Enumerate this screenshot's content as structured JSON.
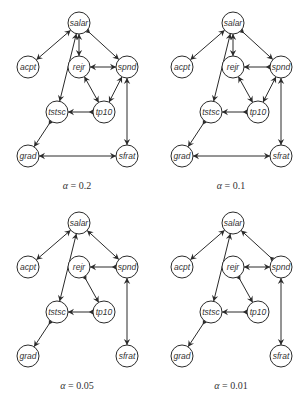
{
  "figure": {
    "node_radius": 11,
    "nodes": [
      {
        "id": "salar",
        "label": "salar",
        "x": 79,
        "y": 23
      },
      {
        "id": "acpt",
        "label": "acpt",
        "x": 28,
        "y": 67
      },
      {
        "id": "rejr",
        "label": "rejr",
        "x": 79,
        "y": 67
      },
      {
        "id": "spnd",
        "label": "spnd",
        "x": 127,
        "y": 67
      },
      {
        "id": "tstsc",
        "label": "tstsc",
        "x": 57,
        "y": 112
      },
      {
        "id": "tp10",
        "label": "tp10",
        "x": 104,
        "y": 112
      },
      {
        "id": "grad",
        "label": "grad",
        "x": 28,
        "y": 156
      },
      {
        "id": "sfrat",
        "label": "sfrat",
        "x": 127,
        "y": 156
      }
    ],
    "colors": {
      "stroke": "#2b2b2b",
      "text": "#333333",
      "background": "#ffffff"
    },
    "panels": [
      {
        "caption_symbol": "α",
        "caption_value": "= 0.2",
        "edges": [
          {
            "from": "salar",
            "to": "acpt",
            "type": "both"
          },
          {
            "from": "salar",
            "to": "rejr",
            "type": "both"
          },
          {
            "from": "salar",
            "to": "spnd",
            "type": "directed"
          },
          {
            "from": "salar",
            "to": "tstsc",
            "type": "both"
          },
          {
            "from": "rejr",
            "to": "spnd",
            "type": "both"
          },
          {
            "from": "rejr",
            "to": "tp10",
            "type": "both"
          },
          {
            "from": "spnd",
            "to": "tp10",
            "type": "both"
          },
          {
            "from": "tp10",
            "to": "tstsc",
            "type": "directed"
          },
          {
            "from": "tstsc",
            "to": "grad",
            "type": "directed"
          },
          {
            "from": "grad",
            "to": "sfrat",
            "type": "both"
          },
          {
            "from": "spnd",
            "to": "sfrat",
            "type": "both"
          }
        ]
      },
      {
        "caption_symbol": "α",
        "caption_value": "= 0.1",
        "edges": [
          {
            "from": "salar",
            "to": "acpt",
            "type": "both"
          },
          {
            "from": "salar",
            "to": "rejr",
            "type": "both"
          },
          {
            "from": "salar",
            "to": "spnd",
            "type": "directed"
          },
          {
            "from": "salar",
            "to": "tstsc",
            "type": "both"
          },
          {
            "from": "spnd",
            "to": "rejr",
            "type": "directed"
          },
          {
            "from": "rejr",
            "to": "tp10",
            "type": "both"
          },
          {
            "from": "spnd",
            "to": "tp10",
            "type": "both"
          },
          {
            "from": "tp10",
            "to": "tstsc",
            "type": "directed"
          },
          {
            "from": "tstsc",
            "to": "grad",
            "type": "directed"
          },
          {
            "from": "grad",
            "to": "sfrat",
            "type": "both"
          },
          {
            "from": "spnd",
            "to": "sfrat",
            "type": "both"
          }
        ]
      },
      {
        "caption_symbol": "α",
        "caption_value": "= 0.05",
        "edges": [
          {
            "from": "salar",
            "to": "acpt",
            "type": "both"
          },
          {
            "from": "salar",
            "to": "tstsc",
            "type": "both"
          },
          {
            "from": "salar",
            "to": "spnd",
            "type": "both"
          },
          {
            "from": "spnd",
            "to": "rejr",
            "type": "directed"
          },
          {
            "from": "rejr",
            "to": "tp10",
            "type": "directed"
          },
          {
            "from": "tp10",
            "to": "tstsc",
            "type": "directed"
          },
          {
            "from": "tstsc",
            "to": "grad",
            "type": "directed"
          },
          {
            "from": "spnd",
            "to": "sfrat",
            "type": "both"
          }
        ]
      },
      {
        "caption_symbol": "α",
        "caption_value": "= 0.01",
        "edges": [
          {
            "from": "salar",
            "to": "acpt",
            "type": "both"
          },
          {
            "from": "salar",
            "to": "tstsc",
            "type": "both"
          },
          {
            "from": "spnd",
            "to": "salar",
            "type": "directed"
          },
          {
            "from": "rejr",
            "to": "spnd",
            "type": "both"
          },
          {
            "from": "rejr",
            "to": "tp10",
            "type": "directed"
          },
          {
            "from": "tp10",
            "to": "tstsc",
            "type": "directed"
          },
          {
            "from": "tstsc",
            "to": "grad",
            "type": "directed"
          },
          {
            "from": "spnd",
            "to": "sfrat",
            "type": "both"
          }
        ]
      }
    ]
  }
}
